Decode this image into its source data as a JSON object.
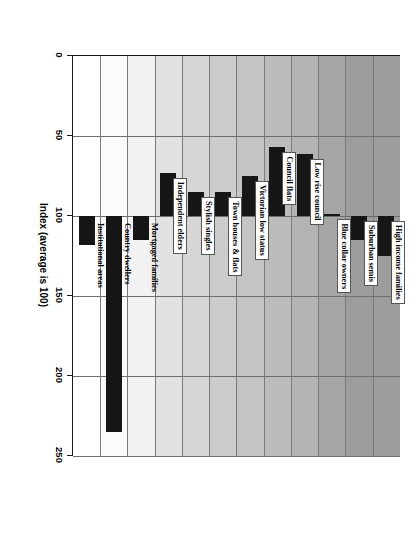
{
  "chart_data": {
    "type": "bar",
    "orientation": "horizontal",
    "title": "",
    "xlabel": "Index (average is 100)",
    "ylabel": "",
    "xlim": [
      0,
      250
    ],
    "xticks": [
      0,
      50,
      100,
      150,
      200,
      250
    ],
    "xticklabels": [
      "0",
      "50",
      "100",
      "150",
      "200",
      "250"
    ],
    "grid": true,
    "reference_line": 100,
    "categories": [
      "High income families",
      "Suburban semis",
      "Blue collar owners",
      "Low rise council",
      "Council flats",
      "Victorian low status",
      "Town houses & flats",
      "Stylish singles",
      "Independent elders",
      "Mortgaged families",
      "Country dwellers",
      "Institutional areas"
    ],
    "values": [
      125,
      115,
      99,
      61,
      57,
      75,
      85,
      85,
      73,
      115,
      235,
      118
    ],
    "bar_color": "#161616",
    "band_shades": [
      "#9d9d9d",
      "#9d9d9d",
      "#a6a6a6",
      "#b3b3b3",
      "#bcbcbc",
      "#c4c4c4",
      "#cccccc",
      "#d6d6d6",
      "#e2e2e2",
      "#f2f2f2",
      "#fbfbfb",
      "#ffffff"
    ]
  },
  "axis": {
    "title": "Index (average is 100)",
    "ticks": [
      "0",
      "50",
      "100",
      "150",
      "200",
      "250"
    ]
  },
  "labels": {
    "high_income_families": "High income families",
    "suburban_semis": "Suburban semis",
    "blue_collar_owners": "Blue collar owners",
    "low_rise_council": "Low rise council",
    "council_flats": "Council flats",
    "victorian_low_status": "Victorian low status",
    "town_houses_flats": "Town houses & flats",
    "stylish_singles": "Stylish singles",
    "independent_elders": "Independent elders",
    "mortgaged_families": "Mortgaged families",
    "country_dwellers": "Country dwellers",
    "institutional_areas": "Institutional areas"
  }
}
